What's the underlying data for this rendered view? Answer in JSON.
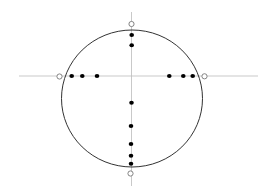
{
  "diagram": {
    "type": "circle-with-axes-and-points",
    "colors": {
      "background": "#ffffff",
      "circle_stroke": "#333333",
      "axis_stroke": "#bbbbbb",
      "point_fill": "#000000",
      "open_marker_stroke": "#777777"
    },
    "circle": {
      "cx": 132,
      "cy": 98.5,
      "rx": 70.5,
      "ry": 68.5
    },
    "axes": {
      "horizontal": {
        "x1": 19,
        "x2": 258,
        "y": 76
      },
      "vertical": {
        "x": 131.5,
        "y1": 12,
        "y2": 186
      }
    },
    "open_markers": [
      {
        "name": "top",
        "x": 131.5,
        "y": 24
      },
      {
        "name": "left",
        "x": 59.5,
        "y": 76.5
      },
      {
        "name": "right",
        "x": 204.5,
        "y": 76.3
      },
      {
        "name": "bottom",
        "x": 130.5,
        "y": 173.5
      }
    ],
    "points": [
      {
        "group": "top-vertical",
        "x": 131.7,
        "y": 35
      },
      {
        "group": "top-vertical",
        "x": 131.7,
        "y": 45.3
      },
      {
        "group": "left-horizontal",
        "x": 71.7,
        "y": 76
      },
      {
        "group": "left-horizontal",
        "x": 82.3,
        "y": 76
      },
      {
        "group": "left-horizontal",
        "x": 97,
        "y": 76
      },
      {
        "group": "right-horizontal",
        "x": 169.3,
        "y": 76
      },
      {
        "group": "right-horizontal",
        "x": 183.3,
        "y": 76
      },
      {
        "group": "right-horizontal",
        "x": 192.7,
        "y": 76
      },
      {
        "group": "bottom-vertical",
        "x": 131.5,
        "y": 102.7
      },
      {
        "group": "bottom-vertical",
        "x": 131,
        "y": 126
      },
      {
        "group": "bottom-vertical",
        "x": 131,
        "y": 144
      },
      {
        "group": "bottom-vertical",
        "x": 131,
        "y": 155.7
      },
      {
        "group": "bottom-vertical",
        "x": 131,
        "y": 163.7
      }
    ]
  }
}
